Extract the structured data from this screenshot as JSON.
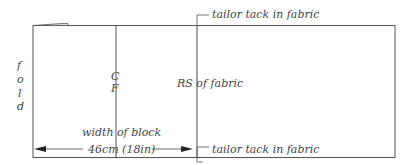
{
  "diagram": {
    "labels": {
      "fold": [
        "f",
        "o",
        "l",
        "d"
      ],
      "centre_front": [
        "C",
        "F"
      ],
      "rs_of_fabric": "RS of fabric",
      "width_of_block": "width of block",
      "measurement": "46cm (18in)",
      "tack_top": "tailor tack in fabric",
      "tack_bottom": "tailor tack in fabric"
    },
    "colors": {
      "line": "#555555",
      "text": "#444444",
      "background": "#ffffff"
    }
  }
}
